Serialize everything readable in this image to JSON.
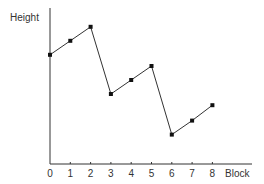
{
  "chart_data": {
    "type": "line",
    "title": "",
    "xlabel": "Block",
    "ylabel": "Height",
    "x": [
      0,
      1,
      2,
      3,
      4,
      5,
      6,
      7,
      8
    ],
    "categories": [
      "0",
      "1",
      "2",
      "3",
      "4",
      "5",
      "6",
      "7",
      "8"
    ],
    "series": [
      {
        "name": "Height",
        "values": [
          7.8,
          8.8,
          9.8,
          5.0,
          6.0,
          7.0,
          2.1,
          3.1,
          4.2
        ],
        "marker": "square"
      }
    ],
    "ylim": [
      0,
      11
    ],
    "xlim": [
      0,
      9.7
    ],
    "y_ticks_shown": false,
    "grid": false,
    "legend": null
  },
  "colors": {
    "line": "#333333",
    "axis": "#333333",
    "background": "#ffffff"
  }
}
